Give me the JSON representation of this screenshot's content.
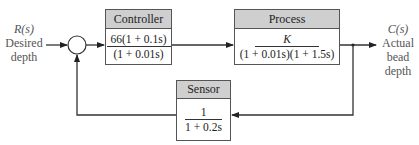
{
  "input": {
    "symbol": "R(s)",
    "lines": [
      "Desired",
      "depth"
    ]
  },
  "output": {
    "symbol": "C(s)",
    "lines": [
      "Actual",
      "bead",
      "depth"
    ]
  },
  "blocks": {
    "controller": {
      "label": "Controller",
      "numerator": "66(1 + 0.1s)",
      "denominator": "(1 + 0.01s)"
    },
    "process": {
      "label": "Process",
      "numerator": "K",
      "denominator": "(1 + 0.01s)(1 + 1.5s)"
    },
    "sensor": {
      "label": "Sensor",
      "numerator": "1",
      "denominator": "1 + 0.2s"
    }
  },
  "summing_junction": {
    "type": "circle"
  },
  "colors": {
    "header": "#cfcfcf",
    "line": "#333333",
    "label": "#555555"
  }
}
